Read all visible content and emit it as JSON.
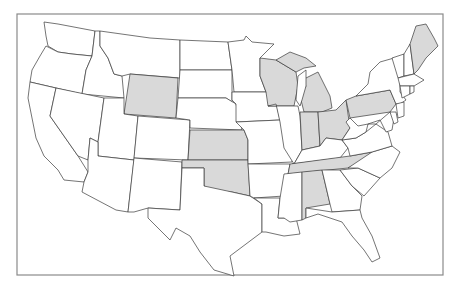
{
  "map": {
    "title": "Contiguous United States",
    "colors": {
      "highlight": "#d9d9d9",
      "default": "#ffffff",
      "border": "#3a3a3a",
      "frame": "#8a8a8a"
    },
    "highlighted_states": [
      "Wyoming",
      "Kansas",
      "Oklahoma",
      "Wisconsin",
      "Michigan",
      "Indiana",
      "Ohio",
      "Pennsylvania",
      "Maine",
      "Tennessee",
      "Alabama"
    ],
    "states": [
      {
        "name": "Washington",
        "id": "WA",
        "highlighted": false,
        "points": "44,22 58,24 95,31 92,56 72,54 58,52 48,46 46,36"
      },
      {
        "name": "Oregon",
        "id": "OR",
        "highlighted": false,
        "points": "46,46 58,52 72,54 92,56 86,70 82,94 56,88 30,82 32,70 40,56"
      },
      {
        "name": "California",
        "id": "CA",
        "highlighted": false,
        "points": "30,82 56,88 50,116 78,156 88,172 84,182 64,180 58,170 44,156 36,138 32,118 28,98"
      },
      {
        "name": "Idaho",
        "id": "ID",
        "highlighted": false,
        "points": "95,31 100,31 100,46 108,58 114,74 122,76 124,98 82,94 86,70 92,56"
      },
      {
        "name": "Nevada",
        "id": "NV",
        "highlighted": false,
        "points": "56,88 104,98 98,142 90,138 88,160 78,156 50,116"
      },
      {
        "name": "Montana",
        "id": "MT",
        "highlighted": false,
        "points": "100,31 150,38 180,40 180,78 130,74 122,76 114,74 108,58 100,46"
      },
      {
        "name": "Wyoming",
        "id": "WY",
        "highlighted": true,
        "points": "130,74 178,78 176,118 124,114"
      },
      {
        "name": "Utah",
        "id": "UT",
        "highlighted": false,
        "points": "104,98 124,98 124,114 138,116 134,160 98,156 98,142"
      },
      {
        "name": "Arizona",
        "id": "AZ",
        "highlighted": false,
        "points": "98,156 134,160 128,212 116,210 82,192 84,182 88,172 88,160 90,138 98,142"
      },
      {
        "name": "Colorado",
        "id": "CO",
        "highlighted": false,
        "points": "138,116 190,120 188,160 134,158"
      },
      {
        "name": "New Mexico",
        "id": "NM",
        "highlighted": false,
        "points": "134,158 182,162 180,210 148,208 134,212 128,212"
      },
      {
        "name": "North Dakota",
        "id": "ND",
        "highlighted": false,
        "points": "180,40 228,42 232,70 180,70"
      },
      {
        "name": "South Dakota",
        "id": "SD",
        "highlighted": false,
        "points": "180,70 232,70 232,102 226,98 178,98"
      },
      {
        "name": "Nebraska",
        "id": "NE",
        "highlighted": false,
        "points": "178,98 226,98 236,104 242,130 190,128 190,120 176,118"
      },
      {
        "name": "Kansas",
        "id": "KS",
        "highlighted": true,
        "points": "190,130 244,130 248,140 248,160 188,160"
      },
      {
        "name": "Oklahoma",
        "id": "OK",
        "highlighted": true,
        "points": "182,160 248,160 250,196 232,192 210,190 204,186 204,168 182,168"
      },
      {
        "name": "Texas",
        "id": "TX",
        "highlighted": false,
        "points": "182,168 204,168 204,186 232,192 250,196 262,204 262,232 246,244 230,256 234,276 214,270 200,252 190,236 176,228 170,240 148,218 148,208 180,210"
      },
      {
        "name": "Minnesota",
        "id": "MN",
        "highlighted": false,
        "points": "228,42 244,40 246,36 252,42 274,44 260,58 260,76 266,92 234,92 232,70"
      },
      {
        "name": "Iowa",
        "id": "IA",
        "highlighted": false,
        "points": "232,92 266,92 276,102 280,120 236,122 236,104 232,100"
      },
      {
        "name": "Missouri",
        "id": "MO",
        "highlighted": false,
        "points": "236,122 280,120 284,130 294,146 292,162 248,164 248,140 244,130"
      },
      {
        "name": "Arkansas",
        "id": "AR",
        "highlighted": false,
        "points": "248,164 290,164 284,196 254,198 250,196"
      },
      {
        "name": "Louisiana",
        "id": "LA",
        "highlighted": false,
        "points": "254,198 280,198 278,218 296,218 300,234 284,236 266,232 262,232 262,204"
      },
      {
        "name": "Wisconsin",
        "id": "WI",
        "highlighted": true,
        "points": "260,58 276,60 296,72 298,86 294,106 268,106 266,92 260,76"
      },
      {
        "name": "Illinois",
        "id": "IL",
        "highlighted": false,
        "points": "268,106 298,106 300,116 302,150 294,164 284,148 280,122 276,104"
      },
      {
        "name": "Michigan",
        "id": "MI",
        "highlighted": true,
        "points": "302,80 318,72 324,84 330,96 332,108 322,112 304,112 300,96 306,86"
      },
      {
        "name": "Michigan Upper Peninsula",
        "id": "MI-UP",
        "highlighted": true,
        "points": "276,60 290,52 306,58 316,66 304,68 296,72"
      },
      {
        "name": "Indiana",
        "id": "IN",
        "highlighted": true,
        "points": "300,112 318,112 320,146 302,150"
      },
      {
        "name": "Ohio",
        "id": "OH",
        "highlighted": true,
        "points": "318,112 336,110 346,100 350,128 342,140 326,138 320,146"
      },
      {
        "name": "Kentucky",
        "id": "KY",
        "highlighted": false,
        "points": "294,164 302,150 320,146 326,138 342,140 348,148 340,158 292,164"
      },
      {
        "name": "Tennessee",
        "id": "TN",
        "highlighted": true,
        "points": "290,164 350,156 372,152 360,162 348,168 288,174"
      },
      {
        "name": "Mississippi",
        "id": "MS",
        "highlighted": false,
        "points": "284,174 302,172 302,220 290,222 284,218 278,218 280,198"
      },
      {
        "name": "Alabama",
        "id": "AL",
        "highlighted": true,
        "points": "302,172 322,170 330,204 306,208 306,218 302,220"
      },
      {
        "name": "Georgia",
        "id": "GA",
        "highlighted": false,
        "points": "322,170 340,170 352,186 362,196 360,210 332,212 330,204"
      },
      {
        "name": "Florida",
        "id": "FL",
        "highlighted": false,
        "points": "306,208 332,212 360,210 362,218 372,236 380,258 372,262 364,250 352,236 342,222 330,218 318,214 306,218"
      },
      {
        "name": "South Carolina",
        "id": "SC",
        "highlighted": false,
        "points": "340,170 358,168 380,178 364,196 352,186"
      },
      {
        "name": "North Carolina",
        "id": "NC",
        "highlighted": false,
        "points": "348,168 372,152 392,146 400,152 392,168 380,178 358,168"
      },
      {
        "name": "Virginia",
        "id": "VA",
        "highlighted": false,
        "points": "342,140 348,148 350,156 372,152 392,146 388,132 376,124 366,132 356,138"
      },
      {
        "name": "West Virginia",
        "id": "WV",
        "highlighted": false,
        "points": "346,122 350,128 342,140 356,138 366,132 368,124 358,126 350,118"
      },
      {
        "name": "Pennsylvania",
        "id": "PA",
        "highlighted": true,
        "points": "346,100 356,96 390,90 396,104 390,112 350,118"
      },
      {
        "name": "New York",
        "id": "NY",
        "highlighted": false,
        "points": "356,96 368,84 370,72 380,62 394,58 400,68 400,92 406,100 400,104 396,104 390,90"
      },
      {
        "name": "Maryland",
        "id": "MD",
        "highlighted": false,
        "points": "368,124 376,124 390,112 394,118 392,130 386,132 380,120"
      },
      {
        "name": "Delaware",
        "id": "DE",
        "highlighted": false,
        "points": "390,112 396,112 398,122 394,124"
      },
      {
        "name": "New Jersey",
        "id": "NJ",
        "highlighted": false,
        "points": "396,104 404,102 404,116 398,118"
      },
      {
        "name": "Vermont",
        "id": "VT",
        "highlighted": false,
        "points": "392,58 404,54 404,76 398,78"
      },
      {
        "name": "New Hampshire",
        "id": "NH",
        "highlighted": false,
        "points": "404,54 410,44 414,74 404,76"
      },
      {
        "name": "Massachusetts",
        "id": "MA",
        "highlighted": false,
        "points": "398,78 414,74 424,80 414,86 400,86"
      },
      {
        "name": "Connecticut",
        "id": "CT",
        "highlighted": false,
        "points": "400,86 410,86 410,94 402,98"
      },
      {
        "name": "Rhode Island",
        "id": "RI",
        "highlighted": false,
        "points": "410,86 414,86 414,92 410,94"
      },
      {
        "name": "Maine",
        "id": "ME",
        "highlighted": true,
        "points": "410,44 416,26 426,24 434,38 438,46 426,58 418,70 414,74"
      }
    ],
    "lakes": [
      {
        "name": "Lake Michigan",
        "points": "298,76 306,70 306,86 302,100 300,106 296,100"
      }
    ]
  }
}
